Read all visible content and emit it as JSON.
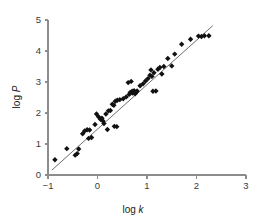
{
  "chart_data": {
    "type": "scatter",
    "title": "",
    "xlabel": "log k",
    "ylabel": "log P",
    "xlim": [
      -1,
      3
    ],
    "ylim": [
      0,
      5
    ],
    "xticks": [
      -1,
      0,
      1,
      2,
      3
    ],
    "yticks": [
      0,
      1,
      2,
      3,
      4,
      5
    ],
    "xtick_labels": [
      "−1",
      "0",
      "1",
      "2",
      "3"
    ],
    "ytick_labels": [
      "0",
      "1",
      "2",
      "3",
      "4",
      "5"
    ],
    "grid": false,
    "legend": null,
    "marker": "diamond",
    "marker_color": "#111111",
    "axis_color": "#8c8c8c",
    "fit_line": {
      "label": "linear regression fit",
      "color": "#6e6e6e",
      "x_start": -0.92,
      "y_start": 0.16,
      "x_end": 2.33,
      "y_end": 4.82,
      "slope": 1.434,
      "intercept": 1.479
    },
    "points": [
      {
        "x": -0.86,
        "y": 0.49
      },
      {
        "x": -0.62,
        "y": 0.85
      },
      {
        "x": -0.45,
        "y": 0.64
      },
      {
        "x": -0.41,
        "y": 0.69
      },
      {
        "x": -0.38,
        "y": 0.84
      },
      {
        "x": -0.3,
        "y": 1.33
      },
      {
        "x": -0.26,
        "y": 1.42
      },
      {
        "x": -0.21,
        "y": 1.46
      },
      {
        "x": -0.18,
        "y": 1.18
      },
      {
        "x": -0.16,
        "y": 1.45
      },
      {
        "x": -0.12,
        "y": 1.21
      },
      {
        "x": -0.05,
        "y": 1.63
      },
      {
        "x": -0.02,
        "y": 1.97
      },
      {
        "x": 0.02,
        "y": 1.88
      },
      {
        "x": 0.06,
        "y": 1.8
      },
      {
        "x": 0.09,
        "y": 1.83
      },
      {
        "x": 0.11,
        "y": 1.74
      },
      {
        "x": 0.13,
        "y": 1.66
      },
      {
        "x": 0.17,
        "y": 1.97
      },
      {
        "x": 0.2,
        "y": 1.47
      },
      {
        "x": 0.22,
        "y": 2.07
      },
      {
        "x": 0.26,
        "y": 2.08
      },
      {
        "x": 0.3,
        "y": 2.28
      },
      {
        "x": 0.33,
        "y": 2.25
      },
      {
        "x": 0.34,
        "y": 1.57
      },
      {
        "x": 0.36,
        "y": 2.38
      },
      {
        "x": 0.39,
        "y": 1.56
      },
      {
        "x": 0.4,
        "y": 2.41
      },
      {
        "x": 0.45,
        "y": 2.43
      },
      {
        "x": 0.52,
        "y": 2.46
      },
      {
        "x": 0.58,
        "y": 2.52
      },
      {
        "x": 0.62,
        "y": 2.98
      },
      {
        "x": 0.64,
        "y": 2.6
      },
      {
        "x": 0.66,
        "y": 2.66
      },
      {
        "x": 0.68,
        "y": 3.02
      },
      {
        "x": 0.7,
        "y": 2.7
      },
      {
        "x": 0.71,
        "y": 2.64
      },
      {
        "x": 0.73,
        "y": 2.68
      },
      {
        "x": 0.74,
        "y": 2.72
      },
      {
        "x": 0.76,
        "y": 2.62
      },
      {
        "x": 0.78,
        "y": 2.66
      },
      {
        "x": 0.8,
        "y": 2.71
      },
      {
        "x": 0.86,
        "y": 2.88
      },
      {
        "x": 0.92,
        "y": 2.94
      },
      {
        "x": 0.97,
        "y": 3.03
      },
      {
        "x": 1.02,
        "y": 3.11
      },
      {
        "x": 1.06,
        "y": 3.22
      },
      {
        "x": 1.08,
        "y": 3.39
      },
      {
        "x": 1.1,
        "y": 3.18
      },
      {
        "x": 1.12,
        "y": 2.7
      },
      {
        "x": 1.14,
        "y": 3.3
      },
      {
        "x": 1.18,
        "y": 2.71
      },
      {
        "x": 1.22,
        "y": 3.41
      },
      {
        "x": 1.26,
        "y": 3.47
      },
      {
        "x": 1.3,
        "y": 3.26
      },
      {
        "x": 1.34,
        "y": 3.5
      },
      {
        "x": 1.42,
        "y": 3.76
      },
      {
        "x": 1.5,
        "y": 3.52
      },
      {
        "x": 1.56,
        "y": 3.9
      },
      {
        "x": 1.7,
        "y": 4.22
      },
      {
        "x": 1.88,
        "y": 4.38
      },
      {
        "x": 2.04,
        "y": 4.48
      },
      {
        "x": 2.1,
        "y": 4.47
      },
      {
        "x": 2.16,
        "y": 4.49
      },
      {
        "x": 2.25,
        "y": 4.49
      }
    ]
  }
}
